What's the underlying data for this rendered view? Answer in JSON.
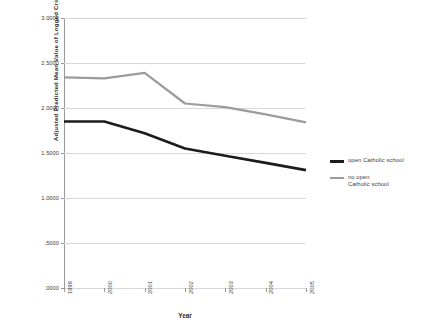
{
  "chart_data": {
    "type": "line",
    "title": "",
    "xlabel": "Year",
    "ylabel": "Adjusted Predicted Mean Value of Logged Crime Rate",
    "categories": [
      "1999",
      "2000",
      "2001",
      "2002",
      "2003",
      "2004",
      "2005"
    ],
    "ylim": [
      0.0,
      3.0
    ],
    "yticks": [
      3.0,
      2.5,
      2.0,
      1.5,
      1.0,
      0.5,
      0.0
    ],
    "ytick_labels": [
      "3.0000",
      "2.5000",
      "2.0000",
      "1.5000",
      "1.0000",
      ".5000",
      ".0000"
    ],
    "grid": true,
    "legend_position": "right",
    "series": [
      {
        "name": "open Catholic school",
        "color": "#1c1c1c",
        "values": [
          1.85,
          1.85,
          1.72,
          1.55,
          1.47,
          1.39,
          1.31
        ]
      },
      {
        "name": "no open Catholic school",
        "color": "#9b9b9b",
        "values": [
          2.34,
          2.33,
          2.39,
          2.05,
          2.01,
          1.93,
          1.84
        ]
      }
    ]
  },
  "legend": {
    "entries": [
      {
        "label": "open Catholic school",
        "label_line2": ""
      },
      {
        "label": "no open",
        "label_line2": "Catholic school"
      }
    ]
  }
}
